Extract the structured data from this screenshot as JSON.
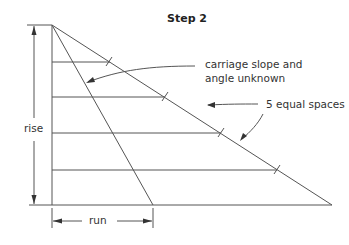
{
  "title": "Step 2",
  "labels": {
    "carriage_line1": "carriage slope and",
    "carriage_line2": "angle unknown",
    "equal_spaces": "5 equal spaces",
    "rise": "rise",
    "run": "run"
  },
  "colors": {
    "line": "#555555",
    "text": "#333333"
  }
}
